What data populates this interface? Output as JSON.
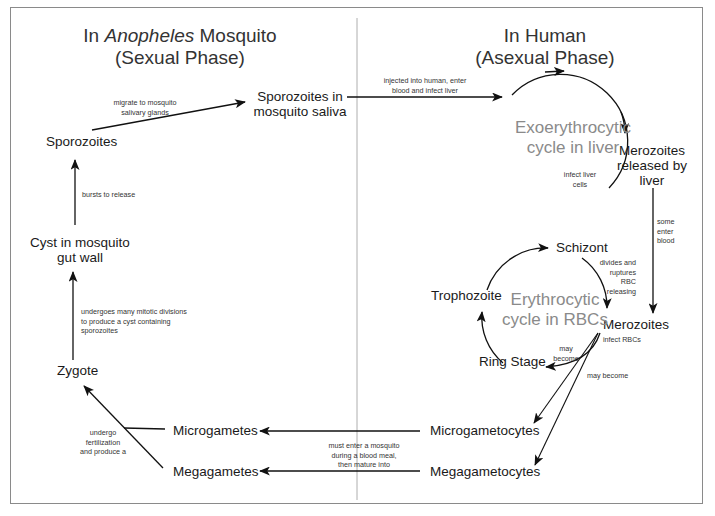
{
  "diagram": {
    "title_left": {
      "line1_pre": "In ",
      "line1_italic": "Anopheles",
      "line1_post": " Mosquito",
      "line2": "(Sexual Phase)"
    },
    "title_right": {
      "line1": "In Human",
      "line2": "(Asexual Phase)"
    },
    "cycles": {
      "liver": {
        "line1": "Exoerythrocytic",
        "line2": "cycle in liver"
      },
      "rbc": {
        "line1": "Erythrocytic",
        "line2": "cycle in RBCs"
      }
    },
    "nodes": {
      "sporozoites_saliva": {
        "line1": "Sporozoites in",
        "line2": "mosquito saliva"
      },
      "sporozoites": "Sporozoites",
      "cyst": {
        "line1": "Cyst in mosquito",
        "line2": "gut wall"
      },
      "zygote": "Zygote",
      "microgametes": "Microgametes",
      "megagametes": "Megagametes",
      "merozoites_liver": {
        "line1": "Merozoites",
        "line2": "released by",
        "line3": "liver"
      },
      "schizont": "Schizont",
      "trophozoite": "Trophozoite",
      "merozoites": "Merozoites",
      "ring_stage": "Ring Stage",
      "microgametocytes": "Microgametocytes",
      "megagametocytes": "Megagametocytes"
    },
    "edge_labels": {
      "migrate": {
        "line1": "migrate to mosquito",
        "line2": "salivary glands"
      },
      "injected": {
        "line1": "injected into human, enter",
        "line2": "blood and infect liver"
      },
      "bursts": "bursts to release",
      "mitotic": {
        "line1": "undergoes many mitotic divisions",
        "line2": "to produce a cyst containing",
        "line3": "sporozoites"
      },
      "infect_liver": {
        "line1": "infect liver",
        "line2": "cells"
      },
      "some_enter": {
        "line1": "some",
        "line2": "enter",
        "line3": "blood"
      },
      "divides": {
        "line1": "divides and",
        "line2": "ruptures",
        "line3": "RBC",
        "line4": "releasing"
      },
      "infect_rbcs": "infect RBCs",
      "may_become_ring": {
        "line1": "may",
        "line2": "become"
      },
      "may_become": "may become",
      "fertilization": {
        "line1": "undergo",
        "line2": "fertilization",
        "line3": "and produce a"
      },
      "must_enter": {
        "line1": "must enter  a mosquito",
        "line2": "during a blood meal,",
        "line3": "then mature into"
      }
    },
    "colors": {
      "line": "#111111",
      "border": "#8a8a8a",
      "divider": "#9a9a9a",
      "cycle_text": "#8a8a8a"
    }
  }
}
